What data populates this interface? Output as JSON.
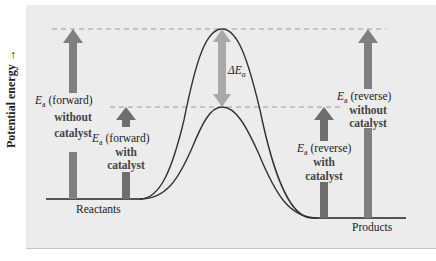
{
  "diagram": {
    "y_axis_label": "Potential energy",
    "y_axis_arrow": "→",
    "labels": {
      "reactants": "Reactants",
      "products": "Products",
      "delta_ea_symbol": "ΔE",
      "delta_ea_sub": "a",
      "ea_symbol": "E",
      "ea_sub": "a",
      "forward_without": {
        "dir": " (forward)",
        "line2": "without",
        "line3": "catalyst"
      },
      "forward_with": {
        "dir": " (forward)",
        "line2": "with",
        "line3": "catalyst"
      },
      "reverse_without": {
        "dir": " (reverse)",
        "line2": "without",
        "line3": "catalyst"
      },
      "reverse_with": {
        "dir": " (reverse)",
        "line2": "with",
        "line3": "catalyst"
      }
    },
    "colors": {
      "background": "#ececec",
      "curve": "#333333",
      "dashed_line": "#9a9a9a",
      "ea_arrow": "#7f7f7f",
      "delta_arrow": "#a9a9a9",
      "baseline": "#222222"
    }
  }
}
